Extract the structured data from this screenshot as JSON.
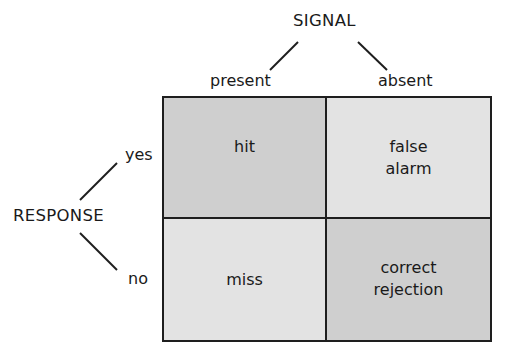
{
  "signal": {
    "title": "SIGNAL",
    "columns": [
      "present",
      "absent"
    ]
  },
  "response": {
    "title": "RESPONSE",
    "rows": [
      "yes",
      "no"
    ]
  },
  "matrix": {
    "cells": [
      {
        "row": "yes",
        "col": "present",
        "lines": [
          "hit"
        ],
        "fill": "#cfcfcf"
      },
      {
        "row": "yes",
        "col": "absent",
        "lines": [
          "false",
          "alarm"
        ],
        "fill": "#e3e3e3"
      },
      {
        "row": "no",
        "col": "present",
        "lines": [
          "miss"
        ],
        "fill": "#e3e3e3"
      },
      {
        "row": "no",
        "col": "absent",
        "lines": [
          "correct",
          "rejection"
        ],
        "fill": "#cfcfcf"
      }
    ]
  }
}
